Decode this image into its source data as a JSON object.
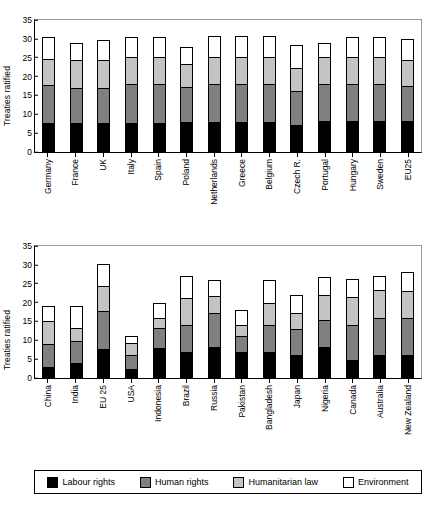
{
  "figure": {
    "ylabel": "Treaties ratified",
    "series_names": [
      "Labour rights",
      "Human rights",
      "Humanitarian law",
      "Environment"
    ],
    "colors": [
      "#000000",
      "#808080",
      "#c4c4c4",
      "#ffffff"
    ]
  },
  "legend": {
    "position": "bottom",
    "items": [
      {
        "label": "Labour rights",
        "color": "#000000"
      },
      {
        "label": "Human rights",
        "color": "#808080"
      },
      {
        "label": "Humanitarian law",
        "color": "#c4c4c4"
      },
      {
        "label": "Environment",
        "color": "#ffffff"
      }
    ]
  },
  "chart_data": [
    {
      "type": "bar",
      "stacked": true,
      "title": "",
      "xlabel": "",
      "ylabel": "Treaties ratified",
      "ylim": [
        0,
        35
      ],
      "yticks": [
        0,
        5,
        10,
        15,
        20,
        25,
        30,
        35
      ],
      "grid": false,
      "legend": "bottom",
      "categories": [
        "Germany",
        "France",
        "UK",
        "Italy",
        "Spain",
        "Poland",
        "Netherlands",
        "Greece",
        "Belgium",
        "Czech R.",
        "Portugal",
        "Hungary",
        "Sweden",
        "EU25"
      ],
      "series": [
        {
          "name": "Labour rights",
          "color": "#000000",
          "values": [
            7.6,
            7.7,
            7.7,
            7.8,
            7.8,
            7.9,
            7.9,
            8.0,
            8.0,
            7.1,
            8.1,
            8.1,
            8.1,
            8.1
          ]
        },
        {
          "name": "Human rights",
          "color": "#808080",
          "values": [
            10.1,
            9.4,
            9.4,
            10.2,
            10.2,
            9.3,
            10.1,
            10.0,
            10.1,
            9.0,
            9.9,
            9.9,
            9.9,
            9.5
          ]
        },
        {
          "name": "Humanitarian law",
          "color": "#c4c4c4",
          "values": [
            7.1,
            7.4,
            7.4,
            7.1,
            7.1,
            6.1,
            7.2,
            7.2,
            7.2,
            6.1,
            7.1,
            7.3,
            7.3,
            6.7
          ]
        },
        {
          "name": "Environment",
          "color": "#ffffff",
          "values": [
            5.7,
            4.4,
            5.2,
            5.5,
            5.5,
            4.6,
            5.5,
            5.5,
            5.5,
            6.1,
            3.7,
            5.3,
            5.3,
            5.6
          ]
        }
      ],
      "totals": [
        30.5,
        28.9,
        29.7,
        30.6,
        30.6,
        27.9,
        30.7,
        30.7,
        30.8,
        28.3,
        28.8,
        30.6,
        30.6,
        29.9
      ]
    },
    {
      "type": "bar",
      "stacked": true,
      "title": "",
      "xlabel": "",
      "ylabel": "Treaties ratified",
      "ylim": [
        0,
        35
      ],
      "yticks": [
        0,
        5,
        10,
        15,
        20,
        25,
        30,
        35
      ],
      "grid": false,
      "legend": "bottom",
      "categories": [
        "China",
        "India",
        "EU 25",
        "USA",
        "Indonesia",
        "Brazil",
        "Russia",
        "Pakistan",
        "Bangladesh",
        "Japan",
        "Nigeria",
        "Canada",
        "Australia",
        "New Zealand"
      ],
      "series": [
        {
          "name": "Labour rights",
          "color": "#000000",
          "values": [
            3.0,
            4.1,
            7.6,
            2.3,
            8.0,
            6.9,
            8.2,
            6.9,
            7.0,
            6.1,
            8.3,
            4.9,
            6.2,
            6.0
          ]
        },
        {
          "name": "Human rights",
          "color": "#808080",
          "values": [
            6.0,
            5.7,
            10.1,
            3.9,
            5.3,
            7.2,
            9.1,
            4.2,
            7.0,
            7.0,
            7.2,
            9.2,
            9.7,
            9.8
          ]
        },
        {
          "name": "Humanitarian law",
          "color": "#c4c4c4",
          "values": [
            6.1,
            3.4,
            6.8,
            3.1,
            2.6,
            7.0,
            4.5,
            2.9,
            6.0,
            4.2,
            6.6,
            7.3,
            7.5,
            7.4
          ]
        },
        {
          "name": "Environment",
          "color": "#ffffff",
          "values": [
            3.9,
            5.9,
            5.7,
            1.8,
            3.9,
            5.9,
            4.2,
            4.0,
            6.1,
            4.6,
            4.8,
            4.8,
            3.6,
            4.9
          ]
        }
      ],
      "totals": [
        19.0,
        19.1,
        30.2,
        11.1,
        19.8,
        27.0,
        26.0,
        18.0,
        26.1,
        21.9,
        26.9,
        26.2,
        27.0,
        28.1
      ]
    }
  ]
}
